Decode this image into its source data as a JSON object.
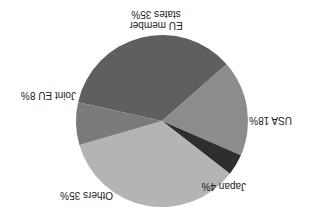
{
  "chart_data": {
    "type": "pie",
    "title": "",
    "orientation_note": "rendered upside down (rotated 180°)",
    "categories": [
      "EU member states",
      "USA",
      "Japan",
      "Others",
      "Joint EU"
    ],
    "values": [
      35,
      18,
      4,
      35,
      8
    ],
    "labels": [
      "EU member states 35%",
      "USA 18%",
      "Japan 4%",
      "Others 35%",
      "Joint EU 8%"
    ],
    "colors": [
      "#5f5f5f",
      "#8c8c8c",
      "#2e2e2e",
      "#b4b4b4",
      "#7a7a7a"
    ],
    "legend": "none (direct labels)"
  },
  "labels": {
    "eu_line1": "EU member",
    "eu_line2": "states 35%",
    "usa": "USA 18%",
    "japan": "Japan 4%",
    "others": "Others 35%",
    "joint": "Joint EU 8%"
  }
}
